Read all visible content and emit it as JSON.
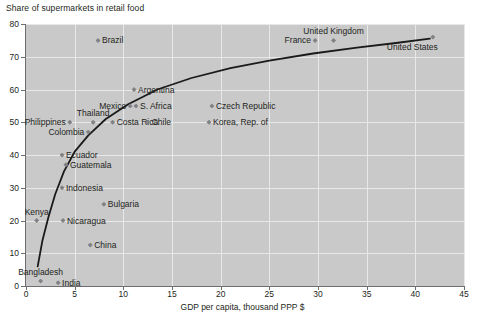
{
  "chart_data": {
    "type": "scatter",
    "title": "Share of supermarkets in retail food",
    "xlabel": "GDP per capita, thousand PPP $",
    "ylabel": "Share of supermarkets in retail food",
    "xlim": [
      0,
      45
    ],
    "ylim": [
      0,
      80
    ],
    "xticks": [
      0,
      5,
      10,
      15,
      20,
      25,
      30,
      35,
      40,
      45
    ],
    "yticks": [
      0,
      10,
      20,
      30,
      40,
      50,
      60,
      70,
      80
    ],
    "grid": true,
    "legend": "none",
    "marker_color": "#808285",
    "trendline_color": "#1a1a1a",
    "plot_background": "#c9c9c9",
    "gridline_color": "#e8e8e8",
    "points": [
      {
        "name": "Brazil",
        "x": 7.4,
        "y": 75,
        "label_pos": "right"
      },
      {
        "name": "Argentina",
        "x": 11.1,
        "y": 60,
        "label_pos": "right"
      },
      {
        "name": "Mexico",
        "x": 10.7,
        "y": 55,
        "label_pos": "left"
      },
      {
        "name": "S. Africa",
        "x": 11.3,
        "y": 55,
        "label_pos": "right"
      },
      {
        "name": "Czech Republic",
        "x": 19.1,
        "y": 55,
        "label_pos": "right"
      },
      {
        "name": "Korea, Rep. of",
        "x": 18.8,
        "y": 50,
        "label_pos": "right"
      },
      {
        "name": "Philippines",
        "x": 4.5,
        "y": 50,
        "label_pos": "left"
      },
      {
        "name": "Thailand",
        "x": 6.9,
        "y": 50,
        "label_pos": "above"
      },
      {
        "name": "Costa Rica",
        "x": 8.9,
        "y": 50,
        "label_pos": "right"
      },
      {
        "name": "Chile",
        "x": 12.5,
        "y": 50,
        "label_pos": "right"
      },
      {
        "name": "Colombia",
        "x": 6.4,
        "y": 47,
        "label_pos": "left"
      },
      {
        "name": "Ecuador",
        "x": 3.7,
        "y": 40,
        "label_pos": "right"
      },
      {
        "name": "Guatemala",
        "x": 4.1,
        "y": 37,
        "label_pos": "right"
      },
      {
        "name": "Indonesia",
        "x": 3.7,
        "y": 30,
        "label_pos": "right"
      },
      {
        "name": "Bulgaria",
        "x": 8.0,
        "y": 25,
        "label_pos": "right"
      },
      {
        "name": "Kenya",
        "x": 1.1,
        "y": 20,
        "label_pos": "above"
      },
      {
        "name": "Nicaragua",
        "x": 3.8,
        "y": 20,
        "label_pos": "right"
      },
      {
        "name": "China",
        "x": 6.6,
        "y": 12.5,
        "label_pos": "right"
      },
      {
        "name": "Bangladesh",
        "x": 1.5,
        "y": 1.5,
        "label_pos": "above"
      },
      {
        "name": "India",
        "x": 3.3,
        "y": 1.0,
        "label_pos": "right"
      },
      {
        "name": "France",
        "x": 29.7,
        "y": 75,
        "label_pos": "left"
      },
      {
        "name": "United Kingdom",
        "x": 31.6,
        "y": 75,
        "label_pos": "above"
      },
      {
        "name": "United States",
        "x": 41.8,
        "y": 76,
        "label_pos": "below-left"
      }
    ],
    "trendline": [
      {
        "x": 1.2,
        "y": 6
      },
      {
        "x": 1.7,
        "y": 14
      },
      {
        "x": 2.3,
        "y": 21
      },
      {
        "x": 3.0,
        "y": 28
      },
      {
        "x": 3.9,
        "y": 35
      },
      {
        "x": 5.0,
        "y": 41
      },
      {
        "x": 6.4,
        "y": 46
      },
      {
        "x": 8.2,
        "y": 51
      },
      {
        "x": 10.5,
        "y": 55.5
      },
      {
        "x": 13.5,
        "y": 60
      },
      {
        "x": 17.0,
        "y": 63.5
      },
      {
        "x": 21.0,
        "y": 66.5
      },
      {
        "x": 25.0,
        "y": 68.8
      },
      {
        "x": 29.5,
        "y": 71
      },
      {
        "x": 34.0,
        "y": 72.8
      },
      {
        "x": 38.0,
        "y": 74.2
      },
      {
        "x": 41.5,
        "y": 75.5
      }
    ]
  }
}
